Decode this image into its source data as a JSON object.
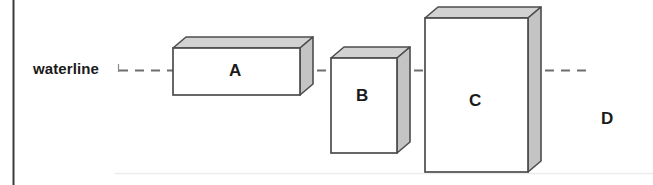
{
  "figure": {
    "width": 653,
    "height": 185,
    "background_color": "#ffffff"
  },
  "annotations": {
    "waterline_label": "waterline",
    "waterline_line_style": "dashed",
    "waterline_y": 70
  },
  "boxes": [
    {
      "id": "box-a",
      "label": "A",
      "front": {
        "x": 173,
        "y": 48,
        "width": 127,
        "height": 47
      },
      "depth": {
        "dx": 13,
        "dy": -11
      },
      "face_color": "#ffffff",
      "top_color": "#d2d2d2",
      "side_color": "#c4c4c4",
      "stroke_color": "#4d4d4d"
    },
    {
      "id": "box-b",
      "label": "B",
      "front": {
        "x": 331,
        "y": 58,
        "width": 66,
        "height": 95
      },
      "depth": {
        "dx": 13,
        "dy": -11
      },
      "face_color": "#ffffff",
      "top_color": "#d2d2d2",
      "side_color": "#c4c4c4",
      "stroke_color": "#4d4d4d"
    },
    {
      "id": "box-c",
      "label": "C",
      "front": {
        "x": 425,
        "y": 18,
        "width": 103,
        "height": 154
      },
      "depth": {
        "dx": 13,
        "dy": -11
      },
      "face_color": "#ffffff",
      "top_color": "#d2d2d2",
      "side_color": "#c4c4c4",
      "stroke_color": "#4d4d4d"
    },
    {
      "id": "box-d",
      "label": "D",
      "front": null,
      "note": "label only, no box drawn"
    }
  ],
  "rules": {
    "left_border": {
      "x": 13,
      "y1": 0,
      "y2": 185,
      "color": "#3a3a3a"
    },
    "bottom_rule": {
      "x1": 115,
      "x2": 653,
      "y": 173,
      "color": "#ebebeb"
    }
  },
  "colors": {
    "stroke": "#4d4d4d",
    "top_face": "#d2d2d2",
    "side_face": "#c4c4c4",
    "front_face": "#ffffff",
    "dash": "#6e6e6e",
    "text": "#1a1a1a"
  }
}
